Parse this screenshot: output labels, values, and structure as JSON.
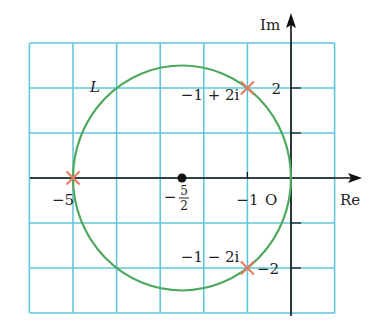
{
  "figure": {
    "type": "complex-plane-diagram",
    "axes": {
      "x_label": "Re",
      "y_label": "Im",
      "origin_label": "O",
      "x_range": [
        -6,
        1
      ],
      "y_range": [
        -3,
        3
      ],
      "grid_step": 1
    },
    "curve": {
      "name": "L",
      "type": "circle",
      "center": {
        "re": -2.5,
        "im": 0
      },
      "radius": 2.5
    },
    "center_point": {
      "re": -2.5,
      "im": 0,
      "label_num": "5",
      "label_den": "2",
      "label_sign": "−"
    },
    "marked_points": [
      {
        "re": -1,
        "im": 2,
        "label": "−1 + 2i"
      },
      {
        "re": -1,
        "im": -2,
        "label": "−1 − 2i"
      },
      {
        "re": -5,
        "im": 0,
        "label": ""
      }
    ],
    "tick_labels": {
      "x": [
        {
          "value": -5,
          "text": "−5"
        },
        {
          "value": -1,
          "text": "−1"
        }
      ],
      "y": [
        {
          "value": 2,
          "text": "2"
        },
        {
          "value": -2,
          "text": "−2"
        }
      ]
    },
    "colors": {
      "grid": "#62c6da",
      "curve": "#4ea85e",
      "marker": "#e77a5c",
      "axis": "#111111"
    }
  }
}
